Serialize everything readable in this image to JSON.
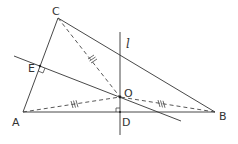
{
  "figure": {
    "type": "geometry-diagram",
    "points": {
      "A": {
        "label": "A",
        "x": 23,
        "y": 112
      },
      "B": {
        "label": "B",
        "x": 215,
        "y": 112
      },
      "C": {
        "label": "C",
        "x": 58,
        "y": 18
      },
      "O": {
        "label": "O",
        "x": 120,
        "y": 97
      },
      "D": {
        "label": "D",
        "x": 120,
        "y": 112
      },
      "E": {
        "label": "E",
        "x": 40,
        "y": 66
      }
    },
    "line_label": "l",
    "segments": {
      "solid": [
        "AB",
        "BC",
        "CA"
      ],
      "dashed": [
        "OA",
        "OB",
        "OC"
      ]
    },
    "lines": [
      {
        "name": "l",
        "through": [
          "D",
          "O"
        ],
        "perpendicular_to": "AB"
      },
      {
        "name": "EO",
        "through": [
          "E",
          "O"
        ],
        "perpendicular_to": "AC"
      }
    ],
    "equal_marks": {
      "OA": "///",
      "OB": "///",
      "OC": "///"
    },
    "right_angles": [
      "D",
      "E"
    ]
  }
}
